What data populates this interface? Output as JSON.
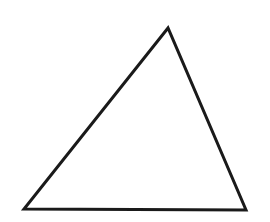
{
  "diagram": {
    "background": "#ffffff",
    "shapes": [
      {
        "type": "triangle",
        "name": "scalene-triangle",
        "vertices": {
          "top": [
            168,
            28
          ],
          "bottom_left": [
            24,
            209
          ],
          "bottom_right": [
            246,
            210
          ]
        },
        "stroke": "#1a1a1a",
        "stroke_width": 3,
        "fill": "none"
      }
    ]
  }
}
